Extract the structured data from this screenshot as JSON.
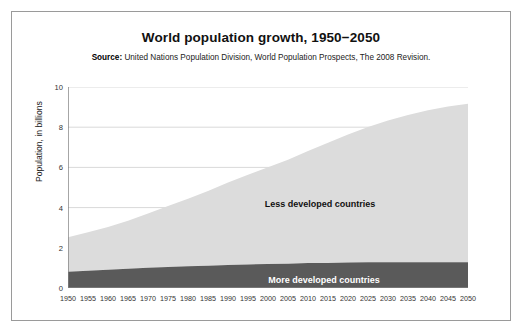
{
  "figure": {
    "title": "World population growth, 1950−2050",
    "source_label": "Source:",
    "source_text": " United Nations Population Division, World Population Prospects, The 2008 Revision."
  },
  "colors": {
    "less_developed": "#DCDCDC",
    "more_developed": "#5A5A5A",
    "axis": "#808080",
    "grid": "#D9D9D9",
    "frame": "#9A9A9A",
    "text": "#222222"
  },
  "chart_data": {
    "type": "area",
    "stacked": true,
    "title": "World population growth, 1950−2050",
    "subtitle": "Source: United Nations Population Division, World Population Prospects, The 2008 Revision.",
    "xlabel": "",
    "ylabel": "Population, in billions",
    "xlim": [
      1950,
      2050
    ],
    "ylim": [
      0,
      10
    ],
    "grid": true,
    "legend_position": "inline-annotation",
    "x": [
      1950,
      1955,
      1960,
      1965,
      1970,
      1975,
      1980,
      1985,
      1990,
      1995,
      2000,
      2005,
      2010,
      2015,
      2020,
      2025,
      2030,
      2035,
      2040,
      2045,
      2050
    ],
    "xtick_labels": [
      "1950",
      "1955",
      "1960",
      "1965",
      "1970",
      "1975",
      "1980",
      "1985",
      "1990",
      "1995",
      "2000",
      "2005",
      "2010",
      "2015",
      "2020",
      "2025",
      "2030",
      "2035",
      "2040",
      "2045",
      "2050"
    ],
    "ytick_labels": [
      "0",
      "2",
      "4",
      "6",
      "8",
      "10"
    ],
    "yticks": [
      0,
      2,
      4,
      6,
      8,
      10
    ],
    "series": [
      {
        "name": "More developed countries",
        "color": "#5A5A5A",
        "values": [
          0.81,
          0.86,
          0.91,
          0.96,
          1.01,
          1.05,
          1.08,
          1.11,
          1.15,
          1.17,
          1.19,
          1.21,
          1.24,
          1.25,
          1.27,
          1.28,
          1.28,
          1.28,
          1.28,
          1.28,
          1.28
        ]
      },
      {
        "name": "Less developed countries",
        "color": "#DCDCDC",
        "values": [
          1.72,
          1.91,
          2.12,
          2.39,
          2.7,
          3.03,
          3.36,
          3.71,
          4.1,
          4.47,
          4.82,
          5.17,
          5.58,
          5.98,
          6.37,
          6.73,
          7.05,
          7.33,
          7.56,
          7.75,
          7.89
        ]
      }
    ],
    "totals": [
      2.53,
      2.77,
      3.03,
      3.35,
      3.71,
      4.08,
      4.44,
      4.82,
      5.25,
      5.64,
      6.01,
      6.38,
      6.82,
      7.23,
      7.64,
      8.01,
      8.33,
      8.61,
      8.84,
      9.03,
      9.17
    ],
    "annotations": [
      {
        "text": "Less developed countries",
        "x": 2013,
        "y": 4.2
      },
      {
        "text": "More developed countries",
        "x": 2014,
        "y": 0.42
      }
    ]
  }
}
